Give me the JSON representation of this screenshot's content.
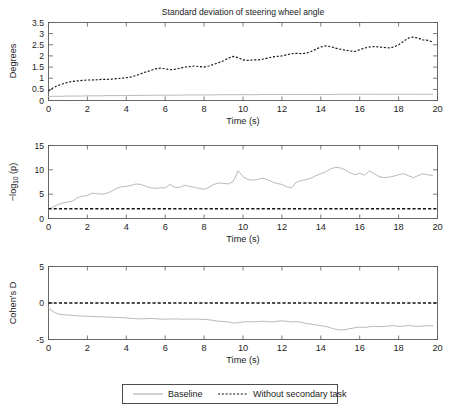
{
  "figure": {
    "title": "Standard deviation of steering wheel angle",
    "xlabel": "Time (s)",
    "legend": {
      "baseline": "Baseline",
      "without": "Without secondary task"
    }
  },
  "panels": {
    "p1": {
      "ylabel": "Degrees",
      "yticks": [
        "0",
        "0.5",
        "1",
        "1.5",
        "2",
        "2.5",
        "3",
        "3.5"
      ],
      "xticks": [
        "0",
        "2",
        "4",
        "6",
        "8",
        "10",
        "12",
        "14",
        "16",
        "18",
        "20"
      ]
    },
    "p2": {
      "ylabel_main": "log",
      "ylabel_sub": "10",
      "ylabel_pre": "−",
      "ylabel_post": " (p)",
      "yticks": [
        "0",
        "5",
        "10",
        "15"
      ],
      "xticks": [
        "0",
        "2",
        "4",
        "6",
        "8",
        "10",
        "12",
        "14",
        "16",
        "18",
        "20"
      ]
    },
    "p3": {
      "ylabel": "Cohen's D",
      "yticks": [
        "-5",
        "0",
        "5"
      ],
      "xticks": [
        "0",
        "2",
        "4",
        "6",
        "8",
        "10",
        "12",
        "14",
        "16",
        "18",
        "20"
      ]
    }
  },
  "chart_data": [
    {
      "type": "line",
      "title": "Standard deviation of steering wheel angle",
      "xlabel": "Time (s)",
      "ylabel": "Degrees",
      "xlim": [
        0,
        20
      ],
      "ylim": [
        0,
        3.5
      ],
      "grid": false,
      "legend_position": "below-figure",
      "x": [
        0,
        0.25,
        0.5,
        0.75,
        1,
        1.25,
        1.5,
        1.75,
        2,
        2.25,
        2.5,
        2.75,
        3,
        3.25,
        3.5,
        3.75,
        4,
        4.25,
        4.5,
        4.75,
        5,
        5.25,
        5.5,
        5.75,
        6,
        6.25,
        6.5,
        6.75,
        7,
        7.25,
        7.5,
        7.75,
        8,
        8.25,
        8.5,
        8.75,
        9,
        9.25,
        9.5,
        9.75,
        10,
        10.25,
        10.5,
        10.75,
        11,
        11.25,
        11.5,
        11.75,
        12,
        12.25,
        12.5,
        12.75,
        13,
        13.25,
        13.5,
        13.75,
        14,
        14.25,
        14.5,
        14.75,
        15,
        15.25,
        15.5,
        15.75,
        16,
        16.25,
        16.5,
        16.75,
        17,
        17.25,
        17.5,
        17.75,
        18,
        18.25,
        18.5,
        18.75,
        19,
        19.25,
        19.5,
        19.75
      ],
      "series": [
        {
          "name": "Baseline",
          "style": "solid",
          "color": "#b8b8b8",
          "values": [
            0.18,
            0.19,
            0.19,
            0.19,
            0.2,
            0.2,
            0.2,
            0.2,
            0.21,
            0.21,
            0.21,
            0.21,
            0.22,
            0.22,
            0.22,
            0.22,
            0.22,
            0.23,
            0.23,
            0.23,
            0.23,
            0.23,
            0.24,
            0.24,
            0.24,
            0.24,
            0.24,
            0.24,
            0.25,
            0.25,
            0.25,
            0.25,
            0.25,
            0.25,
            0.25,
            0.26,
            0.26,
            0.26,
            0.26,
            0.26,
            0.26,
            0.26,
            0.26,
            0.26,
            0.27,
            0.27,
            0.27,
            0.27,
            0.27,
            0.27,
            0.27,
            0.27,
            0.27,
            0.27,
            0.27,
            0.27,
            0.27,
            0.27,
            0.27,
            0.28,
            0.28,
            0.28,
            0.28,
            0.28,
            0.28,
            0.28,
            0.28,
            0.28,
            0.28,
            0.28,
            0.28,
            0.28,
            0.28,
            0.28,
            0.28,
            0.28,
            0.28,
            0.28,
            0.28,
            0.28
          ]
        },
        {
          "name": "Without secondary task",
          "style": "dotted",
          "color": "#141414",
          "values": [
            0.42,
            0.58,
            0.68,
            0.75,
            0.82,
            0.86,
            0.88,
            0.9,
            0.92,
            0.92,
            0.93,
            0.95,
            0.95,
            0.96,
            0.98,
            1.0,
            1.02,
            1.06,
            1.12,
            1.2,
            1.28,
            1.35,
            1.42,
            1.45,
            1.42,
            1.38,
            1.4,
            1.45,
            1.5,
            1.52,
            1.55,
            1.52,
            1.5,
            1.55,
            1.62,
            1.7,
            1.78,
            1.9,
            1.98,
            1.92,
            1.82,
            1.8,
            1.82,
            1.82,
            1.85,
            1.9,
            1.95,
            1.98,
            2.0,
            2.05,
            2.1,
            2.12,
            2.1,
            2.12,
            2.2,
            2.3,
            2.4,
            2.45,
            2.42,
            2.35,
            2.3,
            2.26,
            2.22,
            2.2,
            2.28,
            2.35,
            2.4,
            2.42,
            2.4,
            2.38,
            2.36,
            2.4,
            2.5,
            2.65,
            2.8,
            2.85,
            2.8,
            2.72,
            2.7,
            2.62
          ]
        }
      ]
    },
    {
      "type": "line",
      "xlabel": "Time (s)",
      "ylabel": "-log10 (p)",
      "xlim": [
        0,
        20
      ],
      "ylim": [
        0,
        15
      ],
      "grid": false,
      "x": [
        0,
        0.25,
        0.5,
        0.75,
        1,
        1.25,
        1.5,
        1.75,
        2,
        2.25,
        2.5,
        2.75,
        3,
        3.25,
        3.5,
        3.75,
        4,
        4.25,
        4.5,
        4.75,
        5,
        5.25,
        5.5,
        5.75,
        6,
        6.25,
        6.5,
        6.75,
        7,
        7.25,
        7.5,
        7.75,
        8,
        8.25,
        8.5,
        8.75,
        9,
        9.25,
        9.5,
        9.75,
        10,
        10.25,
        10.5,
        10.75,
        11,
        11.25,
        11.5,
        11.75,
        12,
        12.25,
        12.5,
        12.75,
        13,
        13.25,
        13.5,
        13.75,
        14,
        14.25,
        14.5,
        14.75,
        15,
        15.25,
        15.5,
        15.75,
        16,
        16.25,
        16.5,
        16.75,
        17,
        17.25,
        17.5,
        17.75,
        18,
        18.25,
        18.5,
        18.75,
        19,
        19.25,
        19.5,
        19.75
      ],
      "series": [
        {
          "name": "-log10(p)",
          "style": "solid",
          "color": "#b8b8b8",
          "values": [
            1.9,
            2.4,
            2.9,
            3.2,
            3.4,
            3.6,
            4.3,
            4.6,
            4.7,
            5.2,
            5.1,
            5.0,
            5.2,
            5.6,
            6.2,
            6.5,
            6.6,
            6.8,
            7.1,
            7.0,
            6.6,
            6.3,
            6.2,
            6.3,
            6.3,
            7.0,
            6.4,
            6.4,
            6.8,
            6.6,
            6.4,
            6.2,
            6.0,
            6.4,
            7.0,
            7.3,
            7.2,
            7.1,
            7.6,
            9.8,
            8.6,
            8.0,
            7.9,
            8.0,
            8.3,
            8.0,
            7.5,
            7.2,
            7.0,
            6.5,
            6.3,
            7.5,
            7.8,
            8.0,
            8.3,
            8.8,
            9.2,
            9.6,
            10.2,
            10.5,
            10.4,
            10.0,
            9.4,
            9.0,
            9.3,
            8.9,
            9.8,
            9.2,
            8.6,
            8.4,
            8.5,
            8.7,
            9.0,
            9.2,
            8.8,
            8.4,
            8.8,
            9.2,
            9.0,
            8.8
          ]
        }
      ],
      "annotations": [
        {
          "type": "hline",
          "name": "significance-threshold",
          "value": 2.0,
          "style": "dashed",
          "color": "#111111"
        }
      ]
    },
    {
      "type": "line",
      "xlabel": "Time (s)",
      "ylabel": "Cohen's D",
      "xlim": [
        0,
        20
      ],
      "ylim": [
        -5,
        5
      ],
      "grid": false,
      "x": [
        0,
        0.25,
        0.5,
        0.75,
        1,
        1.25,
        1.5,
        1.75,
        2,
        2.25,
        2.5,
        2.75,
        3,
        3.25,
        3.5,
        3.75,
        4,
        4.25,
        4.5,
        4.75,
        5,
        5.25,
        5.5,
        5.75,
        6,
        6.25,
        6.5,
        6.75,
        7,
        7.25,
        7.5,
        7.75,
        8,
        8.25,
        8.5,
        8.75,
        9,
        9.25,
        9.5,
        9.75,
        10,
        10.25,
        10.5,
        10.75,
        11,
        11.25,
        11.5,
        11.75,
        12,
        12.25,
        12.5,
        12.75,
        13,
        13.25,
        13.5,
        13.75,
        14,
        14.25,
        14.5,
        14.75,
        15,
        15.25,
        15.5,
        15.75,
        16,
        16.25,
        16.5,
        16.75,
        17,
        17.25,
        17.5,
        17.75,
        18,
        18.25,
        18.5,
        18.75,
        19,
        19.25,
        19.5,
        19.75
      ],
      "series": [
        {
          "name": "Cohen's D",
          "style": "solid",
          "color": "#b8b8b8",
          "values": [
            -0.7,
            -1.2,
            -1.5,
            -1.6,
            -1.65,
            -1.7,
            -1.75,
            -1.8,
            -1.82,
            -1.85,
            -1.88,
            -1.9,
            -1.92,
            -1.95,
            -1.98,
            -2.0,
            -2.05,
            -2.1,
            -2.15,
            -2.18,
            -2.15,
            -2.12,
            -2.15,
            -2.2,
            -2.22,
            -2.2,
            -2.18,
            -2.2,
            -2.22,
            -2.2,
            -2.2,
            -2.22,
            -2.25,
            -2.3,
            -2.4,
            -2.5,
            -2.55,
            -2.6,
            -2.75,
            -2.7,
            -2.6,
            -2.55,
            -2.6,
            -2.55,
            -2.5,
            -2.55,
            -2.6,
            -2.5,
            -2.45,
            -2.5,
            -2.6,
            -2.55,
            -2.65,
            -2.8,
            -2.9,
            -3.0,
            -3.1,
            -3.2,
            -3.4,
            -3.6,
            -3.7,
            -3.65,
            -3.5,
            -3.4,
            -3.3,
            -3.35,
            -3.25,
            -3.2,
            -3.25,
            -3.2,
            -3.15,
            -3.1,
            -3.2,
            -3.15,
            -3.1,
            -3.15,
            -3.2,
            -3.15,
            -3.1,
            -3.15
          ]
        }
      ],
      "annotations": [
        {
          "type": "hline",
          "name": "zero-effect-line",
          "value": 0,
          "style": "dashed",
          "color": "#111111"
        }
      ]
    }
  ]
}
